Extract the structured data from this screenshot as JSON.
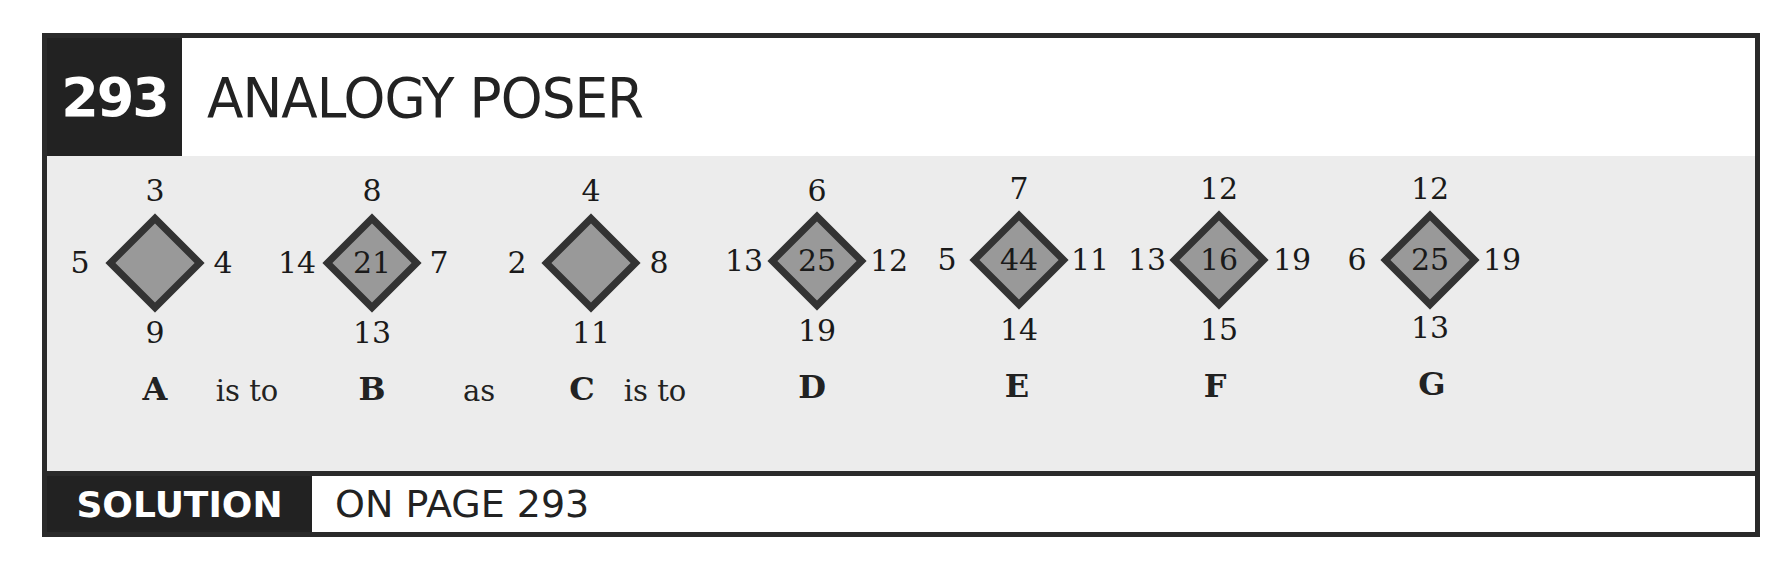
{
  "header": {
    "puzzle_number": "293",
    "title": "ANALOGY POSER"
  },
  "footer": {
    "solution_label": "SOLUTION",
    "solution_text": "ON PAGE 293"
  },
  "colors": {
    "frame": "#2a2a2a",
    "panel": "#ececec",
    "diamond_fill": "#999999",
    "diamond_border": "#333333"
  },
  "figures": [
    {
      "label": "A",
      "top": "3",
      "left": "5",
      "right": "4",
      "bottom": "9",
      "center": ""
    },
    {
      "label": "B",
      "top": "8",
      "left": "14",
      "right": "7",
      "bottom": "13",
      "center": "21"
    },
    {
      "label": "C",
      "top": "4",
      "left": "2",
      "right": "8",
      "bottom": "11",
      "center": ""
    },
    {
      "label": "D",
      "top": "6",
      "left": "13",
      "right": "12",
      "bottom": "19",
      "center": "25"
    },
    {
      "label": "E",
      "top": "7",
      "left": "5",
      "right": "11",
      "bottom": "14",
      "center": "44"
    },
    {
      "label": "F",
      "top": "12",
      "left": "13",
      "right": "19",
      "bottom": "15",
      "center": "16"
    },
    {
      "label": "G",
      "top": "12",
      "left": "6",
      "right": "19",
      "bottom": "13",
      "center": "25"
    }
  ],
  "connectors": {
    "is_to_1": "is to",
    "as": "as",
    "is_to_2": "is to"
  }
}
